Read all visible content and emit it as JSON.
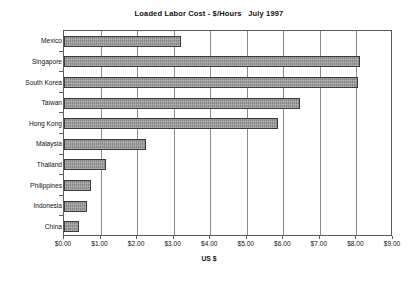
{
  "chart_data": {
    "type": "bar",
    "orientation": "horizontal",
    "title": "Loaded Labor Cost - $/Hours   July 1997",
    "xlabel": "US $",
    "ylabel": "",
    "categories": [
      "Mexico",
      "Singapore",
      "South Korea",
      "Taiwan",
      "Hong Kong",
      "Malaysia",
      "Thailand",
      "Philippines",
      "Indonesia",
      "China"
    ],
    "values": [
      3.2,
      8.1,
      8.05,
      6.45,
      5.85,
      2.25,
      1.15,
      0.75,
      0.62,
      0.4
    ],
    "xlim": [
      0,
      9
    ],
    "xtick_values": [
      0,
      1,
      2,
      3,
      4,
      5,
      6,
      7,
      8,
      9
    ],
    "xtick_labels": [
      "$0.00",
      "$1.00",
      "$2.00",
      "$3.00",
      "$4.00",
      "$5.00",
      "$6.00",
      "$7.00",
      "$8.00",
      "$9.00"
    ],
    "grid": "vertical",
    "legend": "none",
    "bar_color": "#8f8f8f",
    "bar_border_color": "#3a3a3a",
    "axis_color": "#5a5a5a",
    "background_color": "#ffffff"
  }
}
